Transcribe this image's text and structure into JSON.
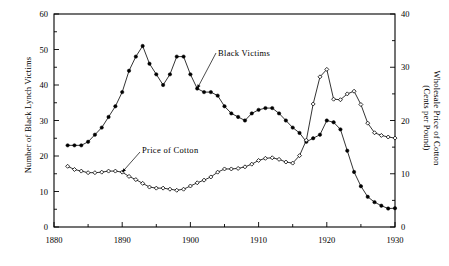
{
  "chart_data": {
    "type": "line",
    "title": "",
    "xlabel": "",
    "xlim": [
      1880,
      1930
    ],
    "xticks": [
      1880,
      1890,
      1900,
      1910,
      1920,
      1930
    ],
    "xtick_labels": [
      "1880",
      "1890",
      "1900",
      "1910",
      "1920",
      "1930"
    ],
    "xminor_step": 5,
    "grid": false,
    "legend_position": "inline-annotations",
    "axes": [
      {
        "id": "left",
        "label": "Number of Black Lynch Victims",
        "lim": [
          0,
          60
        ],
        "ticks": [
          0,
          10,
          20,
          30,
          40,
          50,
          60
        ],
        "tick_labels": [
          "0",
          "10",
          "20",
          "30",
          "40",
          "50",
          "60"
        ],
        "minor_step": 5
      },
      {
        "id": "right",
        "label": "Wholesale Price of Cotton (Cents per Pound)",
        "label_line1": "Wholesale Price of Cotton",
        "label_line2": "(Cents per Pound)",
        "lim": [
          0,
          40
        ],
        "ticks": [
          0,
          10,
          20,
          30,
          40
        ],
        "tick_labels": [
          "0",
          "10",
          "20",
          "30",
          "40"
        ],
        "minor_step": 5
      }
    ],
    "x": [
      1882,
      1883,
      1884,
      1885,
      1886,
      1887,
      1888,
      1889,
      1890,
      1891,
      1892,
      1893,
      1894,
      1895,
      1896,
      1897,
      1898,
      1899,
      1900,
      1901,
      1902,
      1903,
      1904,
      1905,
      1906,
      1907,
      1908,
      1909,
      1910,
      1911,
      1912,
      1913,
      1914,
      1915,
      1916,
      1917,
      1918,
      1919,
      1920,
      1921,
      1922,
      1923,
      1924,
      1925,
      1926,
      1927,
      1928,
      1929,
      1930
    ],
    "series": [
      {
        "name": "Black Victims",
        "axis": "left",
        "marker": "filled-circle",
        "color": "#000000",
        "unit": "victims",
        "values": [
          23,
          23,
          23,
          24,
          26,
          28,
          31,
          34,
          38,
          44,
          48,
          51,
          46,
          43,
          40,
          43,
          48,
          48,
          43,
          39,
          38,
          38,
          37,
          34,
          32,
          31,
          30,
          32,
          33,
          33.5,
          33.5,
          32,
          30,
          28,
          26.5,
          24,
          25,
          26,
          30,
          29.5,
          27.5,
          21.5,
          15.5,
          11.5,
          8.5,
          7,
          6,
          5.2,
          5.3
        ]
      },
      {
        "name": "Price of Cotton",
        "axis": "right",
        "marker": "open-diamond",
        "color": "#000000",
        "unit": "cents per pound",
        "values": [
          11.4,
          10.8,
          10.5,
          10.2,
          10.2,
          10.3,
          10.5,
          10.5,
          10.3,
          9.5,
          8.9,
          8.2,
          7.5,
          7.3,
          7.3,
          7.1,
          6.9,
          7.1,
          7.7,
          8.3,
          8.8,
          9.4,
          10.3,
          10.9,
          10.9,
          11.0,
          11.3,
          11.8,
          12.5,
          12.9,
          13.0,
          12.7,
          12.2,
          12.0,
          13.4,
          16.3,
          23.1,
          28.2,
          29.6,
          24.0,
          23.9,
          25.0,
          25.5,
          23.0,
          19.5,
          17.7,
          17.2,
          16.9,
          16.7
        ]
      }
    ],
    "annotations": [
      {
        "text": "Black Victims",
        "for_series": "Black Victims",
        "points_to_year": 1901,
        "points_to_value": 39
      },
      {
        "text": "Price of Cotton",
        "for_series": "Price of Cotton",
        "points_to_year": 1890,
        "points_to_value": 10.3
      }
    ]
  }
}
